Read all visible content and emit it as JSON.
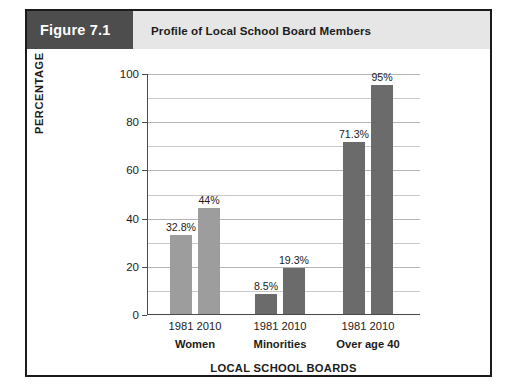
{
  "figure": {
    "number_label": "Figure 7.1",
    "title": "Profile of Local School Board Members",
    "number_box_color": "#4d4d4d",
    "title_band_color": "#e6e6e6",
    "border_color": "#1b1b1b"
  },
  "chart_data": {
    "type": "bar",
    "title": "Profile of Local School Board Members",
    "xlabel": "LOCAL SCHOOL BOARDS",
    "ylabel": "PERCENTAGE",
    "ylim": [
      0,
      100
    ],
    "y_ticks": [
      0,
      20,
      40,
      60,
      80,
      100
    ],
    "y_tick_labels": [
      "0",
      "20",
      "40",
      "60",
      "80",
      "100"
    ],
    "gridline_interval": 10,
    "grid": true,
    "legend": "none",
    "categories": [
      "Women",
      "Minorities",
      "Over age 40"
    ],
    "series": [
      {
        "name": "1981",
        "values": [
          32.8,
          8.5,
          71.3
        ]
      },
      {
        "name": "2010",
        "values": [
          44,
          19.3,
          95
        ]
      }
    ],
    "bars": [
      {
        "group": "Women",
        "year": "1981",
        "value": 32.8,
        "label": "32.8%",
        "color": "#9d9d9d"
      },
      {
        "group": "Women",
        "year": "2010",
        "value": 44,
        "label": "44%",
        "color": "#9d9d9d"
      },
      {
        "group": "Minorities",
        "year": "1981",
        "value": 8.5,
        "label": "8.5%",
        "color": "#6b6b6b"
      },
      {
        "group": "Minorities",
        "year": "2010",
        "value": 19.3,
        "label": "19.3%",
        "color": "#6b6b6b"
      },
      {
        "group": "Over age 40",
        "year": "1981",
        "value": 71.3,
        "label": "71.3%",
        "color": "#6b6b6b"
      },
      {
        "group": "Over age 40",
        "year": "2010",
        "value": 95,
        "label": "95%",
        "color": "#6b6b6b"
      }
    ],
    "group_labels": [
      "Women",
      "Minorities",
      "Over age 40"
    ],
    "x_tick_labels": [
      "1981",
      "2010",
      "1981",
      "2010",
      "1981",
      "2010"
    ]
  }
}
